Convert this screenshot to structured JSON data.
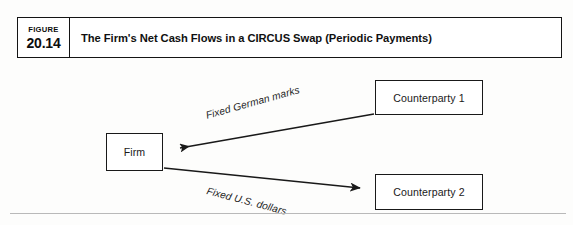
{
  "figure": {
    "label_word": "FIGURE",
    "number": "20.14",
    "title": "The Firm's Net Cash Flows in a CIRCUS Swap (Periodic Payments)"
  },
  "diagram": {
    "type": "flow-diagram",
    "nodes": [
      {
        "id": "firm",
        "label": "Firm"
      },
      {
        "id": "counterparty1",
        "label": "Counterparty 1"
      },
      {
        "id": "counterparty2",
        "label": "Counterparty 2"
      }
    ],
    "edges": [
      {
        "id": "edge-marks",
        "from": "counterparty1",
        "to": "firm",
        "label": "Fixed German marks",
        "direction": "left"
      },
      {
        "id": "edge-dollars",
        "from": "firm",
        "to": "counterparty2",
        "label": "Fixed U.S. dollars",
        "direction": "right"
      }
    ]
  },
  "colors": {
    "line": "#191919",
    "text": "#101010",
    "page_background": "#fdfdfc",
    "rule": "#b9b9b9"
  }
}
